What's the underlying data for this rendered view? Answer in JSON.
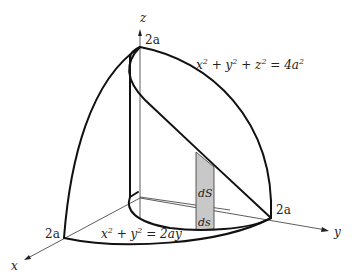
{
  "figure": {
    "axes": {
      "x_label": "x",
      "y_label": "y",
      "z_label": "z"
    },
    "intercepts": {
      "z_top": "2a",
      "x_end": "2a",
      "y_end": "2a"
    },
    "equations": {
      "sphere": {
        "base": "x",
        "parts": [
          "x",
          "2",
          " + y",
          "2",
          " + z",
          "2",
          " = 4a",
          "2"
        ]
      },
      "cylinder": {
        "parts": [
          "x",
          "2",
          " + y",
          "2",
          " = 2ay"
        ]
      }
    },
    "surface_element": {
      "upper_label": "dS",
      "lower_label": "ds",
      "fill_color": "#c8c8c8"
    }
  }
}
